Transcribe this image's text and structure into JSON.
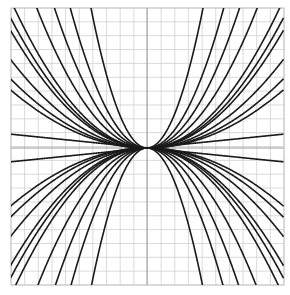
{
  "chart_data": {
    "type": "line",
    "title": "",
    "xlabel": "",
    "ylabel": "",
    "xlim": [
      -1,
      1
    ],
    "ylim": [
      -1,
      1
    ],
    "grid": true,
    "grid_divisions": 20,
    "legend": null,
    "colors": {
      "curve": "#1a1a1a",
      "grid": "#cfcfcf",
      "axis": "#9a9a9a",
      "background": "#ffffff"
    },
    "series": [
      {
        "name": "a=0.94",
        "kind": "parabola",
        "a": 0.94
      },
      {
        "name": "a=1.07",
        "kind": "parabola",
        "a": 1.07
      },
      {
        "name": "a=1.55",
        "kind": "parabola",
        "a": 1.55
      },
      {
        "name": "a=2.2",
        "kind": "parabola",
        "a": 2.2
      },
      {
        "name": "a=3.2",
        "kind": "parabola",
        "a": 3.2
      },
      {
        "name": "a=6.0",
        "kind": "parabola",
        "a": 6.0
      },
      {
        "name": "a=0.85",
        "kind": "parabola",
        "a": 0.85
      },
      {
        "name": "a=0.64",
        "kind": "parabola",
        "a": 0.64
      },
      {
        "name": "a=0.5",
        "kind": "parabola",
        "a": 0.5
      },
      {
        "name": "a=0.42",
        "kind": "parabola",
        "a": 0.42
      },
      {
        "name": "a=-0.94",
        "kind": "parabola",
        "a": -0.94
      },
      {
        "name": "a=-1.07",
        "kind": "parabola",
        "a": -1.07
      },
      {
        "name": "a=-1.55",
        "kind": "parabola",
        "a": -1.55
      },
      {
        "name": "a=-2.2",
        "kind": "parabola",
        "a": -2.2
      },
      {
        "name": "a=-3.2",
        "kind": "parabola",
        "a": -3.2
      },
      {
        "name": "a=-6.0",
        "kind": "parabola",
        "a": -6.0
      },
      {
        "name": "a=-0.85",
        "kind": "parabola",
        "a": -0.85
      },
      {
        "name": "a=-0.64",
        "kind": "parabola",
        "a": -0.64
      },
      {
        "name": "a=-0.5",
        "kind": "parabola",
        "a": -0.5
      },
      {
        "name": "a=-0.42",
        "kind": "parabola",
        "a": -0.42
      },
      {
        "name": "line b=0.1",
        "kind": "line",
        "b": 0.1
      },
      {
        "name": "line b=-0.1",
        "kind": "line",
        "b": -0.1
      }
    ]
  }
}
